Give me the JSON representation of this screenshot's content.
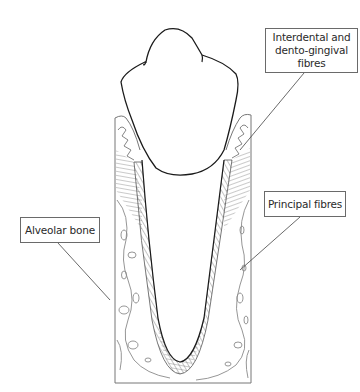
{
  "diagram": {
    "labels": [
      {
        "id": "interdental",
        "lines": [
          "Interdental and",
          "dento-gingival",
          "fibres"
        ]
      },
      {
        "id": "principal",
        "lines": [
          "Principal fibres"
        ]
      },
      {
        "id": "alveolar",
        "lines": [
          "Alveolar bone"
        ]
      }
    ],
    "colors": {
      "outline": "#1a1a1a",
      "hatch": "#555555",
      "bone_lines": "#8a8a8a",
      "label_border": "#6a6a6a",
      "background": "#ffffff"
    }
  }
}
